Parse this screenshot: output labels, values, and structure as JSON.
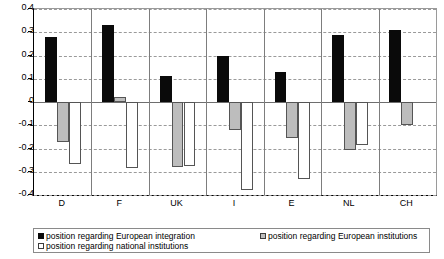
{
  "chart_data": {
    "type": "bar",
    "title": "",
    "xlabel": "",
    "ylabel": "",
    "categories": [
      "D",
      "F",
      "UK",
      "I",
      "E",
      "NL",
      "CH"
    ],
    "ylim": [
      -0.4,
      0.4
    ],
    "yticks": [
      "0.4",
      "0.3",
      "0.2",
      "0.1",
      "0",
      "-0.1",
      "-0.2",
      "-0.3",
      "-0.4"
    ],
    "ytick_values": [
      0.4,
      0.3,
      0.2,
      0.1,
      0,
      -0.1,
      -0.2,
      -0.3,
      -0.4
    ],
    "grid": true,
    "legend_position": "bottom",
    "series": [
      {
        "name": "position regarding European integration",
        "color": "#0a0a0a",
        "values": [
          0.28,
          0.33,
          0.11,
          0.2,
          0.13,
          0.29,
          0.31
        ]
      },
      {
        "name": "position regarding European institutions",
        "color": "#bdbdbd",
        "values": [
          -0.17,
          0.02,
          -0.28,
          -0.12,
          -0.155,
          -0.205,
          -0.1
        ]
      },
      {
        "name": "position regarding national institutions",
        "color": "#ffffff",
        "values": [
          -0.265,
          -0.285,
          -0.275,
          -0.38,
          -0.33,
          -0.185,
          null
        ]
      }
    ]
  }
}
